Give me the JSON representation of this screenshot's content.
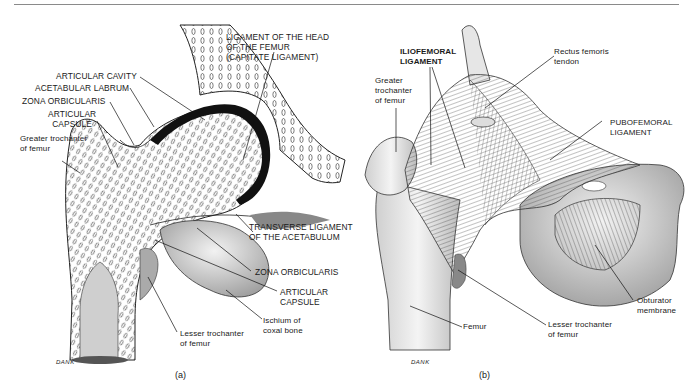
{
  "figure": {
    "panel_a": {
      "caption": "(a)",
      "signature": "DANK",
      "labels": {
        "capitate": [
          "LIGAMENT OF THE HEAD",
          "OF THE FEMUR",
          "(CAPITATE LIGAMENT)"
        ],
        "articular_cavity": "ARTICULAR CAVITY",
        "acetabular_labrum": "ACETABULAR LABRUM",
        "zona_orbicularis_top": "ZONA ORBICULARIS",
        "articular_capsule_top": [
          "ARTICULAR",
          "CAPSULE"
        ],
        "greater_trochanter": [
          "Greater trochanter",
          "of femur"
        ],
        "transverse_ligament": [
          "TRANSVERSE LIGAMENT",
          "OF THE ACETABULUM"
        ],
        "zona_orbicularis_bottom": "ZONA ORBICULARIS",
        "articular_capsule_bottom": [
          "ARTICULAR",
          "CAPSULE"
        ],
        "ischium": [
          "Ischium of",
          "coxal bone"
        ],
        "lesser_trochanter": [
          "Lesser trochanter",
          "of femur"
        ]
      }
    },
    "panel_b": {
      "caption": "(b)",
      "signature": "DANK",
      "labels": {
        "iliofemoral": [
          "ILIOFEMORAL",
          "LIGAMENT"
        ],
        "rectus_femoris": [
          "Rectus femoris",
          "tendon"
        ],
        "greater_trochanter": [
          "Greater",
          "trochanter",
          "of femur"
        ],
        "pubofemoral": [
          "PUBOFEMORAL",
          "LIGAMENT"
        ],
        "obturator": [
          "Obturator",
          "membrane"
        ],
        "lesser_trochanter": [
          "Lesser trochanter",
          "of femur"
        ],
        "femur": "Femur"
      }
    }
  }
}
